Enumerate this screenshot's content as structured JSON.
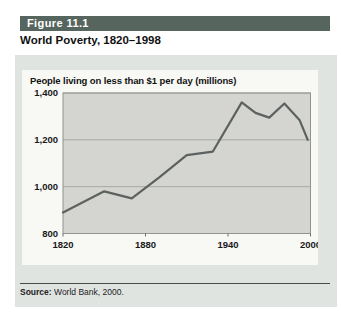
{
  "figure": {
    "label": "Figure 11.1",
    "title": "World Poverty, 1820–1998"
  },
  "source": {
    "label": "Source:",
    "text": " World Bank, 2000."
  },
  "colors": {
    "header_bar": "#57655f",
    "card_bg": "#dfe4e0",
    "panel_bg": "#f8f8f5",
    "plot_bg": "#d4d5d1",
    "line": "#5c625f",
    "grid": "#9b9e99"
  },
  "chart_data": {
    "type": "line",
    "title": "People living on less than $1 per day (millions)",
    "xlabel": "",
    "ylabel": "People living on less than $1 per day (millions)",
    "x": [
      1820,
      1850,
      1870,
      1890,
      1910,
      1929,
      1950,
      1960,
      1970,
      1981,
      1992,
      1998
    ],
    "values": [
      890,
      980,
      950,
      1040,
      1135,
      1150,
      1360,
      1315,
      1295,
      1355,
      1285,
      1200
    ],
    "xlim": [
      1820,
      2000
    ],
    "ylim": [
      800,
      1400
    ],
    "x_ticks": [
      1820,
      1880,
      1940,
      2000
    ],
    "x_tick_labels": [
      "1820",
      "1880",
      "1940",
      "2000"
    ],
    "y_ticks": [
      800,
      1000,
      1200,
      1400
    ],
    "y_tick_labels": [
      "800",
      "1,000",
      "1,200",
      "1,400"
    ],
    "grid": "horizontal",
    "legend": "none",
    "line_color": "#5c625f",
    "plot_bg": "#d4d5d1"
  }
}
